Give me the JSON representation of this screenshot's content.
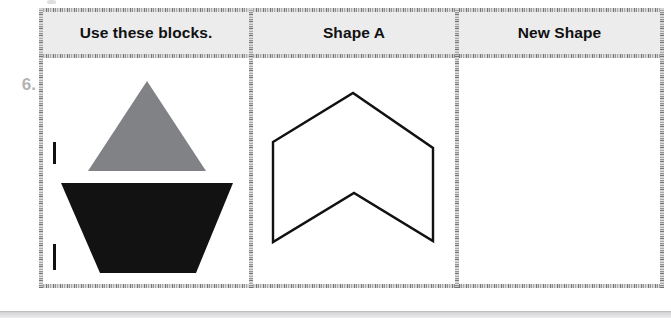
{
  "worksheet": {
    "problem_number": "6.",
    "columns": [
      {
        "id": "use-these-blocks",
        "header": "Use these blocks."
      },
      {
        "id": "shape-a",
        "header": "Shape A"
      },
      {
        "id": "new-shape",
        "header": "New Shape"
      }
    ],
    "blocks": [
      {
        "name": "gray-triangle",
        "shape": "triangle",
        "color": "#808285",
        "unit_tick": true
      },
      {
        "name": "black-trapezoid",
        "shape": "inverted-trapezoid",
        "color": "#121212",
        "unit_tick": true
      }
    ],
    "shape_a": {
      "name": "chevron-outline",
      "shape": "concave-hexagon",
      "stroke": "#111111",
      "fill": "none",
      "stroke_width": 2.4,
      "points": "277,142 357,93 437,148 437,241 358,193 277,242"
    },
    "new_shape": {
      "name": "empty-answer-area",
      "content": ""
    },
    "colors": {
      "header_band": "#ececed",
      "cell_background": "#ffffff",
      "ink": "#111111",
      "problem_number": "#b3b3b3",
      "gray_block": "#808285",
      "black_block": "#121212"
    }
  }
}
